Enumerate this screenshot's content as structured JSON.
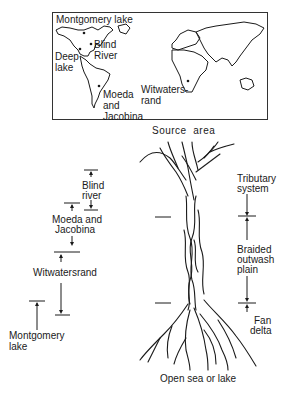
{
  "map": {
    "title": "World map of fluvial deposit localities",
    "labels": {
      "montgomery_lake": "Montgomery lake",
      "blind_river_1": "Blind",
      "blind_river_2": "River",
      "deep_lake_1": "Deep",
      "deep_lake_2": "lake",
      "moeda_1": "Moeda",
      "moeda_2": "and",
      "moeda_3": "Jacobina",
      "witwatersrand_1": "Witwaters-",
      "witwatersrand_2": "rand"
    }
  },
  "left_scale": {
    "items": [
      {
        "label_1": "Blind",
        "label_2": "river"
      },
      {
        "label_1": "Moeda and",
        "label_2": "Jacobina"
      },
      {
        "label_1": "Witwatersrand"
      },
      {
        "label_1": "Montgomery",
        "label_2": "lake"
      }
    ]
  },
  "river_diagram": {
    "top_label": "Source  area",
    "bottom_label": "Open sea or lake",
    "zones": [
      {
        "label_1": "Tributary",
        "label_2": "system"
      },
      {
        "label_1": "Braided",
        "label_2": "outwash",
        "label_3": "plain"
      },
      {
        "label_1": "Fan",
        "label_2": "delta"
      }
    ]
  },
  "colors": {
    "ink": "#1a1a1a",
    "background": "#ffffff"
  }
}
